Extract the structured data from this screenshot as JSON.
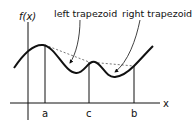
{
  "diagram": {
    "y_axis_label": "f(x)",
    "x_axis_label": "x",
    "ticks": [
      {
        "label": "a"
      },
      {
        "label": "c"
      },
      {
        "label": "b"
      }
    ],
    "annotations": [
      {
        "label": "left trapezoid"
      },
      {
        "label": "right trapezoid"
      }
    ],
    "colors": {
      "line": "#111111",
      "dashed": "#777777"
    }
  }
}
